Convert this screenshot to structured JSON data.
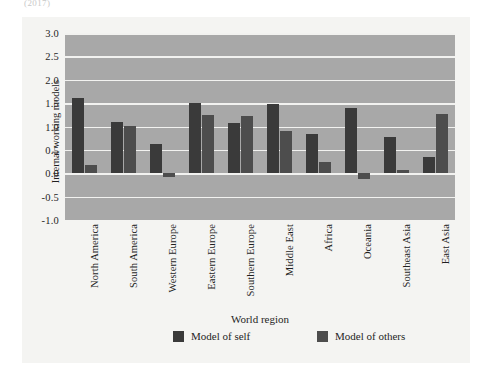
{
  "caption_fragment": "(2017)",
  "chart_data": {
    "type": "bar",
    "title": "",
    "xlabel": "World region",
    "ylabel": "Internal working models",
    "ylim": [
      -1.0,
      3.0
    ],
    "ytick_labels": [
      "3.0",
      "2.5",
      "2.0",
      "1.5",
      "1.0",
      "0.5",
      "0.0",
      "-0.5",
      "-1.0"
    ],
    "ytick_values": [
      3.0,
      2.5,
      2.0,
      1.5,
      1.0,
      0.5,
      0.0,
      -0.5,
      -1.0
    ],
    "grid": true,
    "legend_position": "bottom",
    "categories": [
      "North America",
      "South America",
      "Western Europe",
      "Eastern Europe",
      "Southern Europe",
      "Middle East",
      "Africa",
      "Oceania",
      "Southeast Asia",
      "East Asia"
    ],
    "series": [
      {
        "name": "Model of self",
        "color": "#3a3a3a",
        "values": [
          1.6,
          1.1,
          0.63,
          1.5,
          1.08,
          1.48,
          0.85,
          1.4,
          0.78,
          0.35
        ]
      },
      {
        "name": "Model of others",
        "color": "#4d4d4d",
        "values": [
          0.17,
          1.02,
          -0.09,
          1.25,
          1.23,
          0.9,
          0.25,
          -0.13,
          0.07,
          1.27
        ]
      }
    ]
  },
  "legend": {
    "items": [
      {
        "label": "Model of self",
        "key": "self"
      },
      {
        "label": "Model of others",
        "key": "others"
      }
    ]
  },
  "colors": {
    "plot_background": "#a8a8a8",
    "figure_background": "#f4f4f2",
    "gridline": "#f2f2f0",
    "series_self": "#3a3a3a",
    "series_others": "#4d4d4d"
  }
}
